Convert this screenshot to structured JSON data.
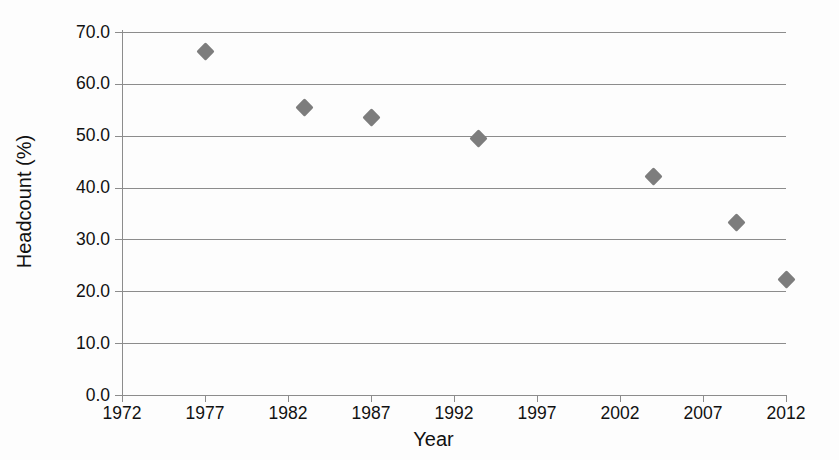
{
  "chart_data": {
    "type": "scatter",
    "title": "",
    "xlabel": "Year",
    "ylabel": "Headcount (%)",
    "xlim": [
      1972,
      2012
    ],
    "ylim": [
      0.0,
      70.0
    ],
    "grid": true,
    "legend": "none",
    "marker_color": "#7d7d7d",
    "marker_shape": "diamond",
    "axis_color": "#8c8c8c",
    "x_ticks": [
      "1972",
      "1977",
      "1982",
      "1987",
      "1992",
      "1997",
      "2002",
      "2007",
      "2012"
    ],
    "x_tick_values": [
      1972,
      1977,
      1982,
      1987,
      1992,
      1997,
      2002,
      2007,
      2012
    ],
    "y_ticks": [
      "0.0",
      "10.0",
      "20.0",
      "30.0",
      "40.0",
      "50.0",
      "60.0",
      "70.0"
    ],
    "y_tick_values": [
      0.0,
      10.0,
      20.0,
      30.0,
      40.0,
      50.0,
      60.0,
      70.0
    ],
    "x": [
      1977,
      1983,
      1987,
      1993.5,
      2004,
      2009,
      2012
    ],
    "values": [
      66.2,
      55.5,
      53.5,
      49.4,
      42.2,
      33.2,
      22.3
    ],
    "points": [
      {
        "x": 1977,
        "y": 66.2
      },
      {
        "x": 1983,
        "y": 55.5
      },
      {
        "x": 1987,
        "y": 53.5
      },
      {
        "x": 1993.5,
        "y": 49.4
      },
      {
        "x": 2004,
        "y": 42.2
      },
      {
        "x": 2009,
        "y": 33.2
      },
      {
        "x": 2012,
        "y": 22.3
      }
    ]
  }
}
